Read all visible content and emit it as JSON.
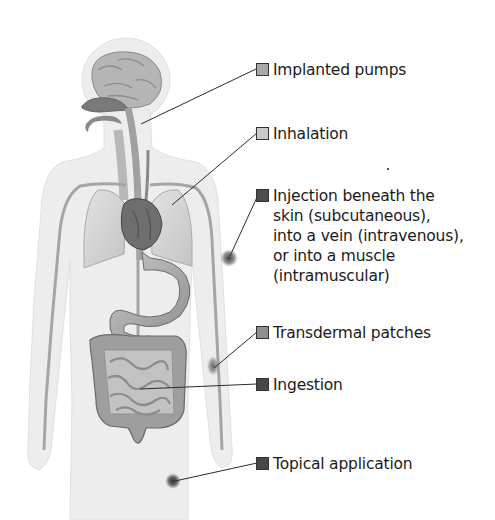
{
  "diagram": {
    "figure": "human-body-anatomy-silhouette",
    "labels": [
      {
        "id": "implanted-pumps",
        "text": "Implanted pumps",
        "swatch_color": "#a9a9a9",
        "x": 255,
        "y": 62
      },
      {
        "id": "inhalation",
        "text": "Inhalation",
        "swatch_color": "#c9c9c9",
        "x": 255,
        "y": 126
      },
      {
        "id": "injection",
        "text": "Injection beneath the\nskin (subcutaneous),\ninto a vein (intravenous),\nor into a muscle\n(intramuscular)",
        "swatch_color": "#4d4d4d",
        "x": 255,
        "y": 188
      },
      {
        "id": "transdermal-patches",
        "text": "Transdermal patches",
        "swatch_color": "#8f8f8f",
        "x": 255,
        "y": 325
      },
      {
        "id": "ingestion",
        "text": "Ingestion",
        "swatch_color": "#474747",
        "x": 255,
        "y": 377
      },
      {
        "id": "topical-application",
        "text": "Topical application",
        "swatch_color": "#484848",
        "x": 255,
        "y": 456
      }
    ],
    "organs": [
      "brain",
      "nasal-cavity",
      "esophagus",
      "trachea",
      "lungs",
      "heart",
      "stomach",
      "large-intestine",
      "small-intestine",
      "blood-vessels"
    ],
    "colors": {
      "silhouette": "#ececec",
      "organ_light": "#d6d6d6",
      "organ_mid": "#a8a8a8",
      "organ_dark": "#6e6e6e",
      "leader_line": "#2b2b2b",
      "site_marker": "#3c3c3c"
    }
  }
}
